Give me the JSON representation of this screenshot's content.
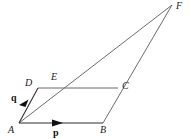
{
  "figure": {
    "type": "geometry-vector-diagram",
    "background_color": "#ffffff",
    "line_color": "#555555",
    "edge_color": "#3a3a3a",
    "arrow_color": "#111111",
    "label_color": "#1a1a1a",
    "width": 190,
    "height": 139
  },
  "points": [
    {
      "id": "A",
      "label": "A",
      "x": 19,
      "y": 123,
      "label_x": 8,
      "label_y": 125
    },
    {
      "id": "B",
      "label": "B",
      "x": 103,
      "y": 123,
      "label_x": 100,
      "label_y": 125
    },
    {
      "id": "C",
      "label": "C",
      "x": 118,
      "y": 88,
      "label_x": 122,
      "label_y": 81
    },
    {
      "id": "D",
      "label": "D",
      "x": 38,
      "y": 88,
      "label_x": 25,
      "label_y": 78
    },
    {
      "id": "E",
      "label": "E",
      "x": 57,
      "y": 88,
      "label_x": 51,
      "label_y": 72
    },
    {
      "id": "F",
      "label": "F",
      "x": 172,
      "y": 5,
      "label_x": 176,
      "label_y": 1
    }
  ],
  "vectors": [
    {
      "id": "p",
      "label": "p",
      "from": "A",
      "to": "B",
      "label_x": 53,
      "label_y": 128,
      "arrow_tip_x": 62,
      "arrow_tip_y": 123
    },
    {
      "id": "q",
      "label": "q",
      "from": "A",
      "to": "D",
      "label_x": 11,
      "label_y": 93,
      "arrow_tip_x": 27,
      "arrow_tip_y": 101
    }
  ],
  "edges": [
    {
      "id": "AB",
      "from": "A",
      "to": "B"
    },
    {
      "id": "DC",
      "from": "D",
      "to": "C"
    },
    {
      "id": "AD",
      "from": "A",
      "to": "D"
    },
    {
      "id": "BF",
      "from": "B",
      "to": "F"
    },
    {
      "id": "AF",
      "from": "A",
      "to": "F"
    }
  ]
}
